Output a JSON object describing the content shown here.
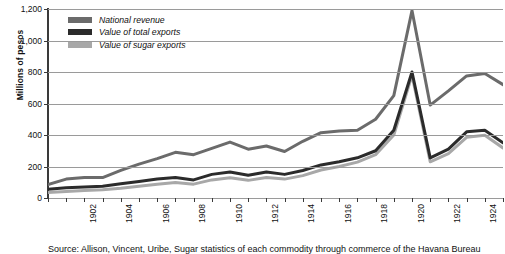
{
  "chart_data": {
    "type": "line",
    "title": "",
    "xlabel": "",
    "ylabel": "Millions of pesos",
    "ylim": [
      0,
      1200
    ],
    "yticks": [
      0,
      200,
      400,
      600,
      800,
      1000,
      1200
    ],
    "ytick_labels": [
      "0",
      "200",
      "400",
      "600",
      "800",
      "1,000",
      "1,200"
    ],
    "grid": true,
    "legend_position": "top-left",
    "x": [
      1900,
      1901,
      1902,
      1903,
      1904,
      1905,
      1906,
      1907,
      1908,
      1909,
      1910,
      1911,
      1912,
      1913,
      1914,
      1915,
      1916,
      1917,
      1918,
      1919,
      1920,
      1921,
      1922,
      1923,
      1924,
      1925
    ],
    "xtick_labels": [
      "",
      "",
      "1902",
      "",
      "1904",
      "",
      "1906",
      "",
      "1908",
      "",
      "1910",
      "",
      "1912",
      "",
      "1914",
      "",
      "1916",
      "",
      "1918",
      "",
      "1920",
      "",
      "1922",
      "",
      "1924",
      ""
    ],
    "series": [
      {
        "name": "National revenue",
        "color": "#6b6b6b",
        "values": [
          85,
          120,
          130,
          130,
          175,
          215,
          250,
          290,
          275,
          315,
          355,
          310,
          330,
          295,
          360,
          415,
          425,
          430,
          500,
          650,
          1190,
          590,
          680,
          775,
          790,
          720
        ]
      },
      {
        "name": "Value of total exports",
        "color": "#2b2b2b",
        "values": [
          55,
          65,
          70,
          75,
          90,
          105,
          120,
          130,
          115,
          150,
          165,
          145,
          165,
          150,
          175,
          210,
          230,
          255,
          300,
          430,
          800,
          255,
          310,
          420,
          430,
          350
        ]
      },
      {
        "name": "Value of sugar exports",
        "color": "#a8a8a8",
        "values": [
          35,
          42,
          48,
          52,
          62,
          75,
          88,
          98,
          88,
          115,
          128,
          112,
          130,
          120,
          142,
          178,
          200,
          228,
          275,
          400,
          780,
          230,
          282,
          385,
          398,
          318
        ]
      }
    ]
  },
  "axes": {
    "y_title": "Millions of pesos"
  },
  "caption": {
    "text": "Source: Allison, Vincent, Uribe, Sugar statistics of each commodity through commerce of the Havana Bureau"
  }
}
